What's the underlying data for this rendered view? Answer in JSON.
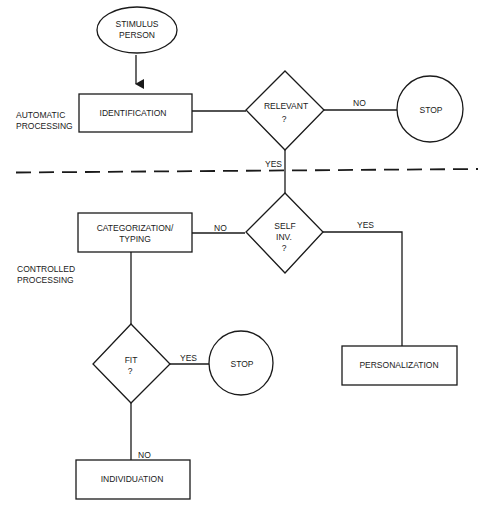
{
  "diagram": {
    "type": "flowchart",
    "regions": {
      "automatic": [
        "AUTOMATIC",
        "PROCESSING"
      ],
      "controlled": [
        "CONTROLLED",
        "PROCESSING"
      ]
    },
    "nodes": {
      "stimulus": {
        "shape": "ellipse",
        "lines": [
          "STIMULUS",
          "PERSON"
        ]
      },
      "identification": {
        "shape": "rect",
        "lines": [
          "IDENTIFICATION"
        ]
      },
      "relevant": {
        "shape": "diamond",
        "lines": [
          "RELEVANT",
          "?"
        ]
      },
      "stop1": {
        "shape": "circle",
        "lines": [
          "STOP"
        ]
      },
      "self_inv": {
        "shape": "diamond",
        "lines": [
          "SELF",
          "INV.",
          "?"
        ]
      },
      "categorization": {
        "shape": "rect",
        "lines": [
          "CATEGORIZATION/",
          "TYPING"
        ]
      },
      "personalization": {
        "shape": "rect",
        "lines": [
          "PERSONALIZATION"
        ]
      },
      "fit": {
        "shape": "diamond",
        "lines": [
          "FIT",
          "?"
        ]
      },
      "stop2": {
        "shape": "circle",
        "lines": [
          "STOP"
        ]
      },
      "individuation": {
        "shape": "rect",
        "lines": [
          "INDIVIDUATION"
        ]
      }
    },
    "edges": {
      "stimulus_to_identification": {
        "label": ""
      },
      "identification_to_relevant": {
        "label": ""
      },
      "relevant_no": {
        "label": "NO"
      },
      "relevant_yes": {
        "label": "YES"
      },
      "self_inv_no": {
        "label": "NO"
      },
      "self_inv_yes": {
        "label": "YES"
      },
      "categorization_to_fit": {
        "label": ""
      },
      "fit_yes": {
        "label": "YES"
      },
      "fit_no": {
        "label": "NO"
      }
    }
  }
}
